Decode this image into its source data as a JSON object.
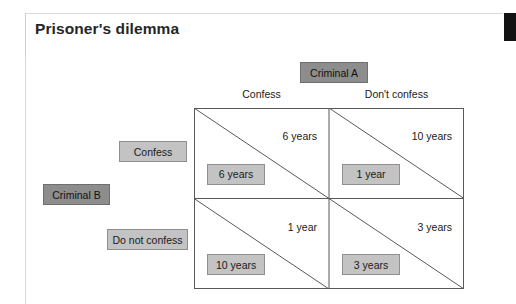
{
  "slide": {
    "title": "Prisoner's dilemma",
    "corner_block_color": "#131313",
    "card_border_color": "#d9d9d9"
  },
  "colors": {
    "box_light_fill": "#c3c3c3",
    "box_light_border": "#8f8f8f",
    "box_dark_fill": "#8d8d8d",
    "box_dark_border": "#6f6f6f",
    "grid_line": "#595959",
    "text": "#1a1a1a"
  },
  "matrix": {
    "column_player_label": "Criminal A",
    "row_player_label": "Criminal B",
    "column_headers": [
      "Confess",
      "Don't confess"
    ],
    "row_headers": [
      "Confess",
      "Do not confess"
    ],
    "cells": [
      [
        {
          "payoff_a": "6 years",
          "payoff_b": "6 years"
        },
        {
          "payoff_a": "10 years",
          "payoff_b": "1 year"
        }
      ],
      [
        {
          "payoff_a": "1 year",
          "payoff_b": "10 years"
        },
        {
          "payoff_a": "3 years",
          "payoff_b": "3 years"
        }
      ]
    ]
  }
}
